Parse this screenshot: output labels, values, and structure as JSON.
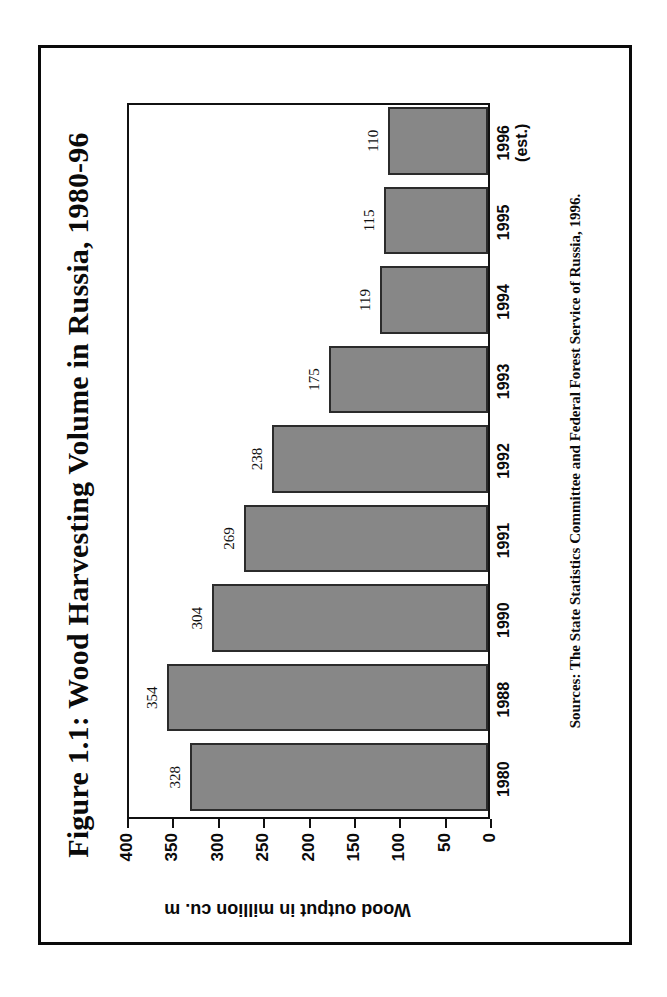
{
  "figure": {
    "title": "Figure 1.1: Wood Harvesting Volume in Russia, 1980-96",
    "source_note": "Sources: The State Statistics Committee and Federal Forest Service of Russia, 1996.",
    "orientation": "page-rotated-90-clockwise",
    "bar_fill_color": "#878787",
    "bar_border_color": "#2b2b2b",
    "frame_color": "#0a0a0a"
  },
  "chart_data": {
    "type": "bar",
    "title": "Figure 1.1: Wood Harvesting Volume in Russia, 1980-96",
    "xlabel": "",
    "ylabel": "Wood output in million cu. m",
    "ylim": [
      0,
      400
    ],
    "yticks": [
      0,
      50,
      100,
      150,
      200,
      250,
      300,
      350,
      400
    ],
    "ytick_labels": [
      "0",
      "50",
      "100",
      "150",
      "200",
      "250",
      "300",
      "350",
      "400"
    ],
    "grid": false,
    "legend": false,
    "categories": [
      "1980",
      "1988",
      "1990",
      "1991",
      "1992",
      "1993",
      "1994",
      "1995",
      "1996 (est.)"
    ],
    "category_labels": [
      {
        "line1": "1980",
        "line2": ""
      },
      {
        "line1": "1988",
        "line2": ""
      },
      {
        "line1": "1990",
        "line2": ""
      },
      {
        "line1": "1991",
        "line2": ""
      },
      {
        "line1": "1992",
        "line2": ""
      },
      {
        "line1": "1993",
        "line2": ""
      },
      {
        "line1": "1994",
        "line2": ""
      },
      {
        "line1": "1995",
        "line2": ""
      },
      {
        "line1": "1996",
        "line2": "(est.)"
      }
    ],
    "values": [
      328,
      354,
      304,
      269,
      238,
      175,
      119,
      115,
      110
    ],
    "data_labels": [
      "328",
      "354",
      "304",
      "269",
      "238",
      "175",
      "119",
      "115",
      "110"
    ],
    "units": "million cu. m"
  }
}
